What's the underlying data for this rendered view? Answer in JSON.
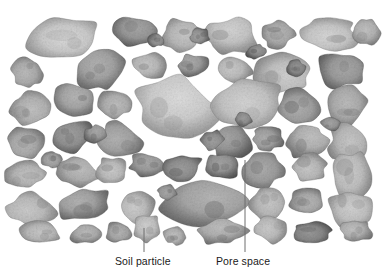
{
  "figure": {
    "type": "scientific-illustration",
    "background_color": "#ffffff",
    "particle_fill_light": "#efeeec",
    "particle_fill_mid": "#a9a7a4",
    "particle_fill_dark": "#55534f",
    "pore_color": "#ffffff",
    "leader_line_color": "#6e6e6e",
    "text_color": "#1a1a1a"
  },
  "labels": [
    {
      "id": "soil-particle",
      "text": "Soil particle",
      "text_x": 115,
      "text_y": 255,
      "leader": {
        "x1": 144,
        "y1": 252,
        "x2": 144,
        "y2": 228
      }
    },
    {
      "id": "pore-space",
      "text": "Pore space",
      "text_x": 216,
      "text_y": 255,
      "leader": {
        "x1": 245,
        "y1": 252,
        "x2": 245,
        "y2": 160
      }
    }
  ],
  "chart_data": {
    "type": "diagram",
    "title": "",
    "particle_count": 63,
    "particles": [
      {
        "cx": 63,
        "cy": 37,
        "rx": 40,
        "ry": 22,
        "rot": -6,
        "tone": 0.18,
        "seed": 1
      },
      {
        "cx": 136,
        "cy": 32,
        "rx": 22,
        "ry": 15,
        "rot": 14,
        "tone": 0.52,
        "seed": 2
      },
      {
        "cx": 182,
        "cy": 35,
        "rx": 23,
        "ry": 17,
        "rot": -8,
        "tone": 0.3,
        "seed": 3
      },
      {
        "cx": 232,
        "cy": 36,
        "rx": 27,
        "ry": 19,
        "rot": 5,
        "tone": 0.22,
        "seed": 4
      },
      {
        "cx": 278,
        "cy": 34,
        "rx": 18,
        "ry": 14,
        "rot": -12,
        "tone": 0.4,
        "seed": 5
      },
      {
        "cx": 330,
        "cy": 35,
        "rx": 29,
        "ry": 19,
        "rot": 7,
        "tone": 0.2,
        "seed": 6
      },
      {
        "cx": 366,
        "cy": 32,
        "rx": 16,
        "ry": 14,
        "rot": -15,
        "tone": 0.34,
        "seed": 7
      },
      {
        "cx": 28,
        "cy": 73,
        "rx": 17,
        "ry": 16,
        "rot": 10,
        "tone": 0.38,
        "seed": 8
      },
      {
        "cx": 100,
        "cy": 70,
        "rx": 26,
        "ry": 19,
        "rot": -18,
        "tone": 0.44,
        "seed": 9
      },
      {
        "cx": 151,
        "cy": 66,
        "rx": 19,
        "ry": 13,
        "rot": 8,
        "tone": 0.3,
        "seed": 10
      },
      {
        "cx": 193,
        "cy": 66,
        "rx": 17,
        "ry": 12,
        "rot": -5,
        "tone": 0.48,
        "seed": 11
      },
      {
        "cx": 236,
        "cy": 70,
        "rx": 17,
        "ry": 13,
        "rot": 12,
        "tone": 0.28,
        "seed": 12
      },
      {
        "cx": 283,
        "cy": 72,
        "rx": 33,
        "ry": 22,
        "rot": -7,
        "tone": 0.24,
        "seed": 13
      },
      {
        "cx": 340,
        "cy": 70,
        "rx": 24,
        "ry": 19,
        "rot": 9,
        "tone": 0.5,
        "seed": 14
      },
      {
        "cx": 30,
        "cy": 108,
        "rx": 20,
        "ry": 17,
        "rot": -10,
        "tone": 0.34,
        "seed": 15
      },
      {
        "cx": 75,
        "cy": 100,
        "rx": 22,
        "ry": 15,
        "rot": 16,
        "tone": 0.42,
        "seed": 16
      },
      {
        "cx": 114,
        "cy": 104,
        "rx": 19,
        "ry": 16,
        "rot": -6,
        "tone": 0.36,
        "seed": 17
      },
      {
        "cx": 176,
        "cy": 110,
        "rx": 44,
        "ry": 34,
        "rot": 4,
        "tone": 0.16,
        "seed": 18
      },
      {
        "cx": 247,
        "cy": 103,
        "rx": 37,
        "ry": 26,
        "rot": -9,
        "tone": 0.22,
        "seed": 19
      },
      {
        "cx": 300,
        "cy": 108,
        "rx": 22,
        "ry": 19,
        "rot": 11,
        "tone": 0.46,
        "seed": 20
      },
      {
        "cx": 345,
        "cy": 106,
        "rx": 22,
        "ry": 20,
        "rot": -13,
        "tone": 0.38,
        "seed": 21
      },
      {
        "cx": 27,
        "cy": 143,
        "rx": 20,
        "ry": 16,
        "rot": 7,
        "tone": 0.4,
        "seed": 22
      },
      {
        "cx": 73,
        "cy": 136,
        "rx": 22,
        "ry": 16,
        "rot": -14,
        "tone": 0.56,
        "seed": 23
      },
      {
        "cx": 120,
        "cy": 140,
        "rx": 22,
        "ry": 18,
        "rot": 6,
        "tone": 0.44,
        "seed": 24
      },
      {
        "cx": 232,
        "cy": 143,
        "rx": 22,
        "ry": 17,
        "rot": -8,
        "tone": 0.52,
        "seed": 25
      },
      {
        "cx": 268,
        "cy": 138,
        "rx": 17,
        "ry": 13,
        "rot": 13,
        "tone": 0.46,
        "seed": 26
      },
      {
        "cx": 306,
        "cy": 142,
        "rx": 22,
        "ry": 19,
        "rot": -5,
        "tone": 0.34,
        "seed": 27
      },
      {
        "cx": 349,
        "cy": 143,
        "rx": 21,
        "ry": 21,
        "rot": 10,
        "tone": 0.3,
        "seed": 28
      },
      {
        "cx": 25,
        "cy": 175,
        "rx": 22,
        "ry": 14,
        "rot": -7,
        "tone": 0.32,
        "seed": 29
      },
      {
        "cx": 76,
        "cy": 172,
        "rx": 25,
        "ry": 14,
        "rot": 9,
        "tone": 0.36,
        "seed": 30
      },
      {
        "cx": 112,
        "cy": 170,
        "rx": 16,
        "ry": 14,
        "rot": -11,
        "tone": 0.28,
        "seed": 31
      },
      {
        "cx": 147,
        "cy": 166,
        "rx": 19,
        "ry": 13,
        "rot": 5,
        "tone": 0.5,
        "seed": 32
      },
      {
        "cx": 182,
        "cy": 168,
        "rx": 21,
        "ry": 14,
        "rot": -9,
        "tone": 0.58,
        "seed": 33
      },
      {
        "cx": 221,
        "cy": 166,
        "rx": 19,
        "ry": 13,
        "rot": 12,
        "tone": 0.54,
        "seed": 34
      },
      {
        "cx": 263,
        "cy": 170,
        "rx": 22,
        "ry": 18,
        "rot": -6,
        "tone": 0.48,
        "seed": 35
      },
      {
        "cx": 309,
        "cy": 167,
        "rx": 19,
        "ry": 15,
        "rot": 8,
        "tone": 0.3,
        "seed": 36
      },
      {
        "cx": 352,
        "cy": 175,
        "rx": 22,
        "ry": 24,
        "rot": -4,
        "tone": 0.26,
        "seed": 37
      },
      {
        "cx": 32,
        "cy": 210,
        "rx": 26,
        "ry": 18,
        "rot": 6,
        "tone": 0.28,
        "seed": 38
      },
      {
        "cx": 85,
        "cy": 205,
        "rx": 28,
        "ry": 17,
        "rot": -10,
        "tone": 0.44,
        "seed": 39
      },
      {
        "cx": 137,
        "cy": 206,
        "rx": 19,
        "ry": 18,
        "rot": 7,
        "tone": 0.26,
        "seed": 40
      },
      {
        "cx": 205,
        "cy": 206,
        "rx": 44,
        "ry": 24,
        "rot": -5,
        "tone": 0.42,
        "seed": 41
      },
      {
        "cx": 268,
        "cy": 204,
        "rx": 20,
        "ry": 17,
        "rot": 11,
        "tone": 0.3,
        "seed": 42
      },
      {
        "cx": 306,
        "cy": 200,
        "rx": 17,
        "ry": 14,
        "rot": -8,
        "tone": 0.4,
        "seed": 43
      },
      {
        "cx": 350,
        "cy": 208,
        "rx": 22,
        "ry": 20,
        "rot": 5,
        "tone": 0.24,
        "seed": 44
      },
      {
        "cx": 40,
        "cy": 232,
        "rx": 22,
        "ry": 11,
        "rot": 4,
        "tone": 0.3,
        "seed": 45
      },
      {
        "cx": 86,
        "cy": 234,
        "rx": 17,
        "ry": 10,
        "rot": -8,
        "tone": 0.38,
        "seed": 46
      },
      {
        "cx": 118,
        "cy": 232,
        "rx": 14,
        "ry": 11,
        "rot": 10,
        "tone": 0.42,
        "seed": 47
      },
      {
        "cx": 147,
        "cy": 228,
        "rx": 15,
        "ry": 14,
        "rot": -6,
        "tone": 0.24,
        "seed": 48
      },
      {
        "cx": 175,
        "cy": 236,
        "rx": 12,
        "ry": 9,
        "rot": 7,
        "tone": 0.34,
        "seed": 49
      },
      {
        "cx": 222,
        "cy": 232,
        "rx": 27,
        "ry": 13,
        "rot": -4,
        "tone": 0.36,
        "seed": 50
      },
      {
        "cx": 272,
        "cy": 230,
        "rx": 18,
        "ry": 13,
        "rot": 9,
        "tone": 0.28,
        "seed": 51
      },
      {
        "cx": 312,
        "cy": 232,
        "rx": 22,
        "ry": 12,
        "rot": -7,
        "tone": 0.62,
        "seed": 52
      },
      {
        "cx": 356,
        "cy": 231,
        "rx": 16,
        "ry": 12,
        "rot": 6,
        "tone": 0.34,
        "seed": 53
      },
      {
        "cx": 200,
        "cy": 36,
        "rx": 10,
        "ry": 8,
        "rot": 0,
        "tone": 0.55,
        "seed": 54
      },
      {
        "cx": 256,
        "cy": 52,
        "rx": 11,
        "ry": 7,
        "rot": -20,
        "tone": 0.6,
        "seed": 55
      },
      {
        "cx": 155,
        "cy": 40,
        "rx": 9,
        "ry": 7,
        "rot": 18,
        "tone": 0.58,
        "seed": 56
      },
      {
        "cx": 96,
        "cy": 134,
        "rx": 12,
        "ry": 9,
        "rot": -12,
        "tone": 0.5,
        "seed": 57
      },
      {
        "cx": 296,
        "cy": 68,
        "rx": 10,
        "ry": 8,
        "rot": 10,
        "tone": 0.62,
        "seed": 58
      },
      {
        "cx": 212,
        "cy": 140,
        "rx": 12,
        "ry": 10,
        "rot": -9,
        "tone": 0.56,
        "seed": 59
      },
      {
        "cx": 331,
        "cy": 124,
        "rx": 10,
        "ry": 8,
        "rot": 14,
        "tone": 0.52,
        "seed": 60
      },
      {
        "cx": 52,
        "cy": 160,
        "rx": 11,
        "ry": 8,
        "rot": -5,
        "tone": 0.46,
        "seed": 61
      },
      {
        "cx": 243,
        "cy": 120,
        "rx": 9,
        "ry": 8,
        "rot": 6,
        "tone": 0.58,
        "seed": 62
      },
      {
        "cx": 167,
        "cy": 192,
        "rx": 10,
        "ry": 8,
        "rot": -11,
        "tone": 0.5,
        "seed": 63
      }
    ]
  }
}
